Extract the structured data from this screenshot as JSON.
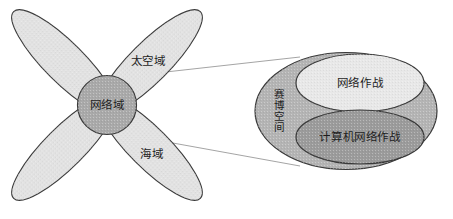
{
  "figure": {
    "title_text": "",
    "background_color": "#ffffff",
    "stroke_color": "#3a3a3a",
    "text_color": "#1d1d1d"
  },
  "left_diagram": {
    "name": "four-petal-domain-diagram",
    "center": {
      "label": "网络域",
      "fill_color": "#a9a9a9"
    },
    "petals": [
      {
        "id": "land",
        "label": "陆域",
        "position": "top-left",
        "fill_color": "#e2e2e2"
      },
      {
        "id": "space",
        "label": "太空域",
        "position": "top-right",
        "fill_color": "#e2e2e2"
      },
      {
        "id": "air",
        "label": "空域",
        "position": "bottom-left",
        "fill_color": "#e2e2e2"
      },
      {
        "id": "sea",
        "label": "海域",
        "position": "bottom-right",
        "fill_color": "#e2e2e2"
      }
    ]
  },
  "right_diagram": {
    "name": "cyberspace-nested-ellipses",
    "outer": {
      "label": "赛博空间",
      "label_orientation": "vertical",
      "fill_color": "#b4b4b4"
    },
    "ellipses": [
      {
        "id": "network-operations",
        "label": "网络作战",
        "fill_color": "#e8e8e8"
      },
      {
        "id": "computer-network-operations",
        "label": "计算机网络作战",
        "fill_color": "#9b9b9b"
      }
    ]
  },
  "connectors": {
    "count": 2,
    "from": "网络域",
    "to": "赛博空间",
    "line_color": "#8d8d8d"
  }
}
